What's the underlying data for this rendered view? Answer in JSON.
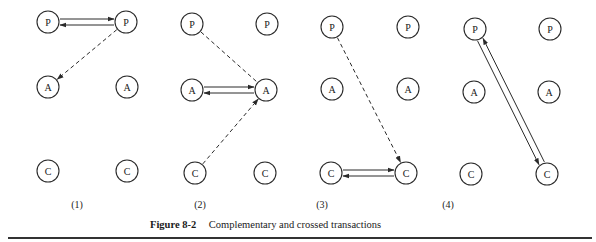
{
  "figure": {
    "number": "Figure 8-2",
    "caption": "Complementary and crossed transactions"
  },
  "node_radius": 11,
  "panels": [
    {
      "label": "(1)",
      "label_x": 77,
      "nodes": [
        {
          "id": "P1",
          "text": "P",
          "x": 48,
          "y": 22
        },
        {
          "id": "P2",
          "text": "P",
          "x": 126,
          "y": 22
        },
        {
          "id": "A1",
          "text": "A",
          "x": 48,
          "y": 87
        },
        {
          "id": "A2",
          "text": "A",
          "x": 127,
          "y": 87
        },
        {
          "id": "C1",
          "text": "C",
          "x": 48,
          "y": 171
        },
        {
          "id": "C2",
          "text": "C",
          "x": 127,
          "y": 171
        }
      ],
      "arrows": [
        {
          "from": "P1",
          "to": "P2",
          "style": "solid",
          "offset": -3
        },
        {
          "from": "P2",
          "to": "P1",
          "style": "solid",
          "offset": -3
        },
        {
          "from": "P2",
          "to": "A1",
          "style": "dashed",
          "offset": 0
        }
      ]
    },
    {
      "label": "(2)",
      "label_x": 200,
      "nodes": [
        {
          "id": "P1",
          "text": "P",
          "x": 192,
          "y": 24
        },
        {
          "id": "P2",
          "text": "P",
          "x": 267,
          "y": 24
        },
        {
          "id": "A1",
          "text": "A",
          "x": 192,
          "y": 90
        },
        {
          "id": "A2",
          "text": "A",
          "x": 266,
          "y": 90
        },
        {
          "id": "C1",
          "text": "C",
          "x": 195,
          "y": 173
        },
        {
          "id": "C2",
          "text": "C",
          "x": 265,
          "y": 173
        }
      ],
      "arrows": [
        {
          "from": "P1",
          "to": "A2",
          "style": "dashed",
          "offset": 0,
          "no_head": true
        },
        {
          "from": "A1",
          "to": "A2",
          "style": "solid",
          "offset": -3
        },
        {
          "from": "A2",
          "to": "A1",
          "style": "solid",
          "offset": -3
        },
        {
          "from": "C1",
          "to": "A2",
          "style": "dashed",
          "offset": 0
        }
      ]
    },
    {
      "label": "(3)",
      "label_x": 322,
      "nodes": [
        {
          "id": "P1",
          "text": "P",
          "x": 332,
          "y": 27
        },
        {
          "id": "P2",
          "text": "P",
          "x": 408,
          "y": 27
        },
        {
          "id": "A1",
          "text": "A",
          "x": 332,
          "y": 89
        },
        {
          "id": "A2",
          "text": "A",
          "x": 408,
          "y": 89
        },
        {
          "id": "C1",
          "text": "C",
          "x": 331,
          "y": 173
        },
        {
          "id": "C2",
          "text": "C",
          "x": 406,
          "y": 173
        }
      ],
      "arrows": [
        {
          "from": "P1",
          "to": "C2",
          "style": "dashed",
          "offset": 0
        },
        {
          "from": "C1",
          "to": "C2",
          "style": "solid",
          "offset": -3
        },
        {
          "from": "C2",
          "to": "C1",
          "style": "solid",
          "offset": -3
        }
      ]
    },
    {
      "label": "(4)",
      "label_x": 448,
      "nodes": [
        {
          "id": "P1",
          "text": "P",
          "x": 475,
          "y": 29
        },
        {
          "id": "P2",
          "text": "P",
          "x": 550,
          "y": 29
        },
        {
          "id": "A1",
          "text": "A",
          "x": 474,
          "y": 92
        },
        {
          "id": "A2",
          "text": "A",
          "x": 549,
          "y": 92
        },
        {
          "id": "C1",
          "text": "C",
          "x": 471,
          "y": 174
        },
        {
          "id": "C2",
          "text": "C",
          "x": 547,
          "y": 174
        }
      ],
      "arrows": [
        {
          "from": "P1",
          "to": "C2",
          "style": "solid",
          "offset": 3
        },
        {
          "from": "C2",
          "to": "P1",
          "style": "solid",
          "offset": 3
        }
      ]
    }
  ]
}
